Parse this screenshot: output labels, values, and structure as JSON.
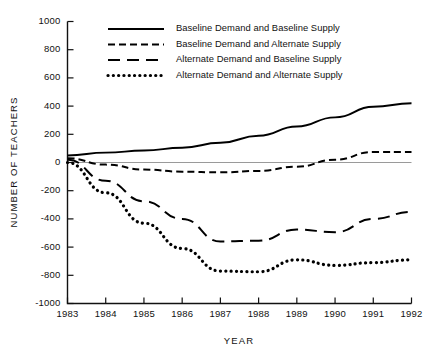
{
  "chart_data": {
    "type": "line",
    "title": "",
    "xlabel": "YEAR",
    "ylabel": "NUMBER OF TEACHERS",
    "x": [
      1983,
      1984,
      1985,
      1986,
      1987,
      1988,
      1989,
      1990,
      1991,
      1992
    ],
    "categories": [
      "1983",
      "1984",
      "1985",
      "1986",
      "1987",
      "1988",
      "1989",
      "1990",
      "1991",
      "1992"
    ],
    "xlim": [
      1983,
      1992
    ],
    "ylim": [
      -1000,
      1000
    ],
    "yticks": [
      1000,
      800,
      600,
      400,
      200,
      0,
      -200,
      -400,
      -600,
      -800,
      -1000
    ],
    "ytick_labels": [
      "1000",
      "800",
      "600",
      "400",
      "200",
      "0",
      "-200",
      "-400",
      "-600",
      "-800",
      "-1000"
    ],
    "grid": false,
    "legend_position": "upper-center-inside",
    "zero_reference_line": true,
    "series": [
      {
        "name": "Baseline Demand and Baseline Supply",
        "style": "solid",
        "values": [
          50,
          70,
          85,
          105,
          140,
          190,
          255,
          320,
          395,
          420
        ]
      },
      {
        "name": "Baseline Demand and Alternate Supply",
        "style": "dashed",
        "values": [
          30,
          -15,
          -50,
          -65,
          -70,
          -60,
          -30,
          20,
          75,
          75
        ]
      },
      {
        "name": "Alternate Demand and Baseline Supply",
        "style": "long-dash",
        "values": [
          20,
          -130,
          -275,
          -400,
          -560,
          -555,
          -475,
          -495,
          -400,
          -350
        ]
      },
      {
        "name": "Alternate Demand and Alternate Supply",
        "style": "dotted",
        "values": [
          0,
          -215,
          -430,
          -610,
          -770,
          -775,
          -690,
          -730,
          -710,
          -690
        ]
      }
    ]
  },
  "legend": {
    "items": [
      {
        "label": "Baseline Demand and Baseline Supply",
        "style": "solid"
      },
      {
        "label": "Baseline Demand and Alternate Supply",
        "style": "dashed"
      },
      {
        "label": "Alternate Demand and Baseline Supply",
        "style": "long-dash"
      },
      {
        "label": "Alternate Demand and Alternate Supply",
        "style": "dotted"
      }
    ]
  },
  "axes": {
    "x_title": "YEAR",
    "y_title": "NUMBER OF TEACHERS"
  }
}
